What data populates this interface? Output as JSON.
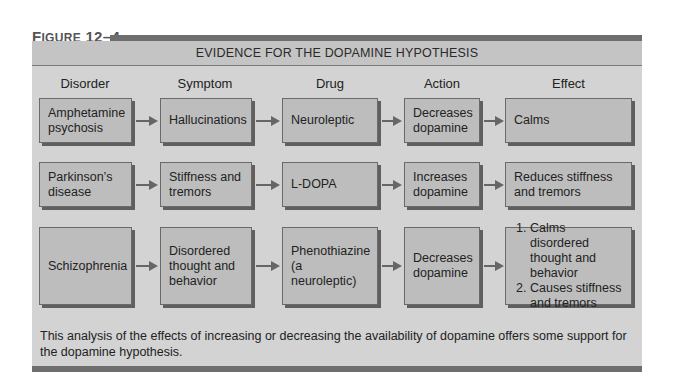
{
  "figure": {
    "label_prefix": "F",
    "label_rest": "IGURE",
    "label_number": "12–4",
    "title": "EVIDENCE FOR THE DOPAMINE HYPOTHESIS"
  },
  "columns": [
    "Disorder",
    "Symptom",
    "Drug",
    "Action",
    "Effect"
  ],
  "rows": [
    {
      "disorder": "Amphetamine psychosis",
      "symptom": "Hallucinations",
      "drug": "Neuroleptic",
      "action": "Decreases dopamine",
      "effect": "Calms"
    },
    {
      "disorder": "Parkinson’s disease",
      "symptom": "Stiffness and tremors",
      "drug": "L-DOPA",
      "action": "Increases dopamine",
      "effect": "Reduces stiffness and tremors"
    },
    {
      "disorder": "Schizophrenia",
      "symptom": "Disordered thought and behavior",
      "drug": "Phenothiazine (a neuroleptic)",
      "action": "Decreases dopamine",
      "effect_list": [
        "Calms disordered thought and behavior",
        "Causes stiffness and tremors"
      ]
    }
  ],
  "caption": "This analysis of the effects of increasing or decreasing the availability of dopamine offers some support for the dopamine hypothesis.",
  "colors": {
    "panel": "#d3d3d3",
    "header_band": "#c4c4c4",
    "box_fill": "#bdbdbd",
    "rule": "#6e6e6e"
  }
}
